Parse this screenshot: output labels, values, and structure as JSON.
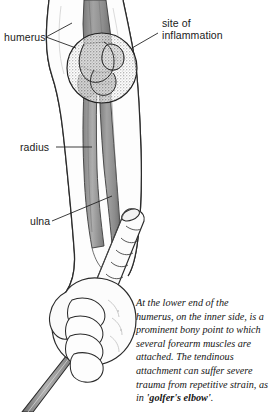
{
  "figure": {
    "background_color": "#ffffff",
    "ink_color": "#1a1a1a",
    "bone_color": "#9a9a9a",
    "bone_dark_color": "#7d7d7d",
    "skin_color": "#fbfbfb",
    "stipple_color": "#9d9d9d",
    "club_shaft_color": "#8e8e8e"
  },
  "labels": {
    "humerus": "humerus",
    "site_of_inflammation_line1": "site of",
    "site_of_inflammation_line2": "inflammation",
    "radius": "radius",
    "ulna": "ulna"
  },
  "caption": {
    "line1": "At the lower end of the",
    "line2": "humerus, on the inner side, is a",
    "line3": "prominent bony point to which",
    "line4": "several forearm muscles are",
    "line5": "attached. The tendinous",
    "line6": "attachment can suffer severe",
    "line7": "trauma from repetitive strain, as",
    "line8_prefix": "in ",
    "line8_emphasis": "'golfer's elbow'",
    "line8_suffix": "."
  }
}
